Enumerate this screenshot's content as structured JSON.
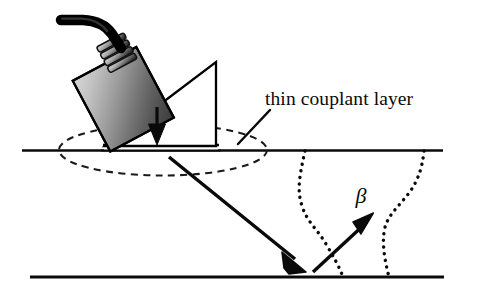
{
  "figure": {
    "background_color": "#ffffff",
    "ink_color": "#0a0a0a",
    "width": 484,
    "height": 298
  },
  "labels": {
    "couplant_label": "thin couplant layer",
    "beam_angle_symbol": "β"
  },
  "components": {
    "cable": {
      "name": "transducer cable",
      "color": "#000000",
      "stroke_width": 9
    },
    "connector": {
      "name": "ribbed strain relief connector",
      "color": "#1a1a1a",
      "rib_count": 4
    },
    "probe": {
      "name": "ultrasonic transducer housing",
      "shape": "rotated rectangle",
      "rotation_deg": -28,
      "gradient_light": "#d2d2d2",
      "gradient_mid": "#8f8f8f",
      "gradient_dark": "#3a3a3a",
      "outline_color": "#000000"
    },
    "wedge": {
      "name": "angle beam wedge",
      "shape": "right triangle",
      "fill": "#ffffff",
      "outline_color": "#000000"
    },
    "couplant_layer": {
      "name": "thin couplant layer",
      "fill": "#ffffff",
      "outline_color": "#0a0a0a",
      "thickness_px": 5
    },
    "couplant_spread": {
      "name": "dashed couplant spread ellipse",
      "style": "dashed",
      "dash_pattern": "7,5",
      "color": "#1a1a1a"
    },
    "specimen": {
      "name": "test specimen",
      "top_surface_color": "#0a0a0a",
      "bottom_surface_color": "#0a0a0a",
      "top_surface_y": 149,
      "bottom_surface_y": 277
    },
    "cracks": [
      {
        "name": "crack-indication-left",
        "style": "dotted",
        "color": "#0a0a0a",
        "dot_size": 3.4
      },
      {
        "name": "crack-indication-right",
        "style": "dotted",
        "color": "#0a0a0a",
        "dot_size": 3.4
      }
    ],
    "beams": {
      "coupling_arrow": {
        "name": "downward coupling arrow",
        "direction": "down",
        "color": "#0a0a0a"
      },
      "incident_beam": {
        "name": "incident sound beam",
        "direction": "down-right",
        "color": "#0a0a0a",
        "stroke_width": 3.4
      },
      "reflected_beam": {
        "name": "reflected sound beam",
        "direction": "up-right",
        "color": "#0a0a0a",
        "stroke_width": 3.4
      }
    },
    "leader_line": {
      "name": "label leader line",
      "color": "#0a0a0a",
      "stroke_width": 2.4
    }
  }
}
